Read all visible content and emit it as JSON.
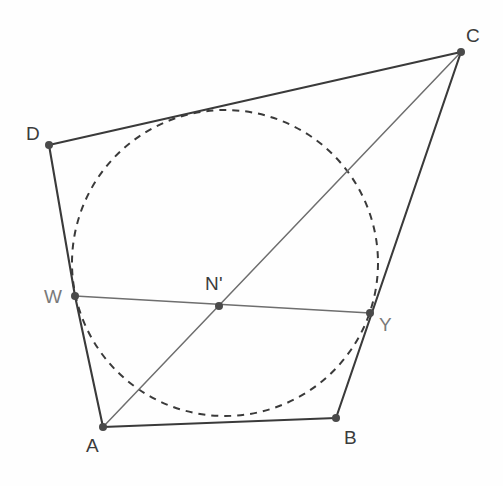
{
  "figure": {
    "background_color": "#fefefe",
    "width": 503,
    "height": 486
  },
  "style": {
    "side_color": "#3a3a3a",
    "side_width": 2.1,
    "chord_color": "#6e6e6e",
    "chord_width": 1.5,
    "diagonal_color": "#6e6e6e",
    "diagonal_width": 1.5,
    "circle_color": "#3a3a3a",
    "circle_width": 2.0,
    "circle_dash": "7 6",
    "dot_color": "#4a4a4a",
    "dot_radius": 4.0,
    "label_color": "#3b3b3b",
    "muted_label_color": "#7a7a7a"
  },
  "points": {
    "A": {
      "label": "A",
      "x": 103,
      "y": 427,
      "label_x": 86,
      "label_y": 452,
      "dot": true,
      "muted": false
    },
    "B": {
      "label": "B",
      "x": 336,
      "y": 418,
      "label_x": 344,
      "label_y": 444,
      "dot": true,
      "muted": false
    },
    "C": {
      "label": "C",
      "x": 461,
      "y": 52,
      "label_x": 466,
      "label_y": 42,
      "dot": true,
      "muted": false
    },
    "D": {
      "label": "D",
      "x": 49,
      "y": 145,
      "label_x": 26,
      "label_y": 140,
      "dot": true,
      "muted": false
    },
    "W": {
      "label": "W",
      "x": 75,
      "y": 296,
      "label_x": 44,
      "label_y": 303,
      "dot": true,
      "muted": true
    },
    "Y": {
      "label": "Y",
      "x": 370,
      "y": 313,
      "label_x": 379,
      "label_y": 331,
      "dot": true,
      "muted": true
    },
    "N": {
      "label": "N'",
      "x": 219,
      "y": 306,
      "label_x": 205,
      "label_y": 290,
      "dot": true,
      "muted": false
    }
  },
  "circle": {
    "name": "inscribed-circle",
    "center_x": 225,
    "center_y": 263,
    "radius": 153,
    "dashed": true,
    "label": "inscribed circle"
  },
  "segments": [
    {
      "name": "side-AB",
      "from": "A",
      "to": "B",
      "kind": "side",
      "label": "AB"
    },
    {
      "name": "side-BC",
      "from": "B",
      "to": "C",
      "kind": "side",
      "label": "BC"
    },
    {
      "name": "side-CD",
      "from": "C",
      "to": "D",
      "kind": "side",
      "label": "CD"
    },
    {
      "name": "side-DW",
      "from": "D",
      "to": "W",
      "kind": "side",
      "label": "DW"
    },
    {
      "name": "side-WA",
      "from": "W",
      "to": "A",
      "kind": "side",
      "label": "WA"
    },
    {
      "name": "chord-WY",
      "from": "W",
      "to": "Y",
      "kind": "chord",
      "label": "WY"
    },
    {
      "name": "diagonal-AC",
      "from": "A",
      "to": "C",
      "kind": "diagonal",
      "label": "AC"
    }
  ],
  "labels_list": [
    "A",
    "B",
    "C",
    "D",
    "W",
    "Y",
    "N'"
  ]
}
